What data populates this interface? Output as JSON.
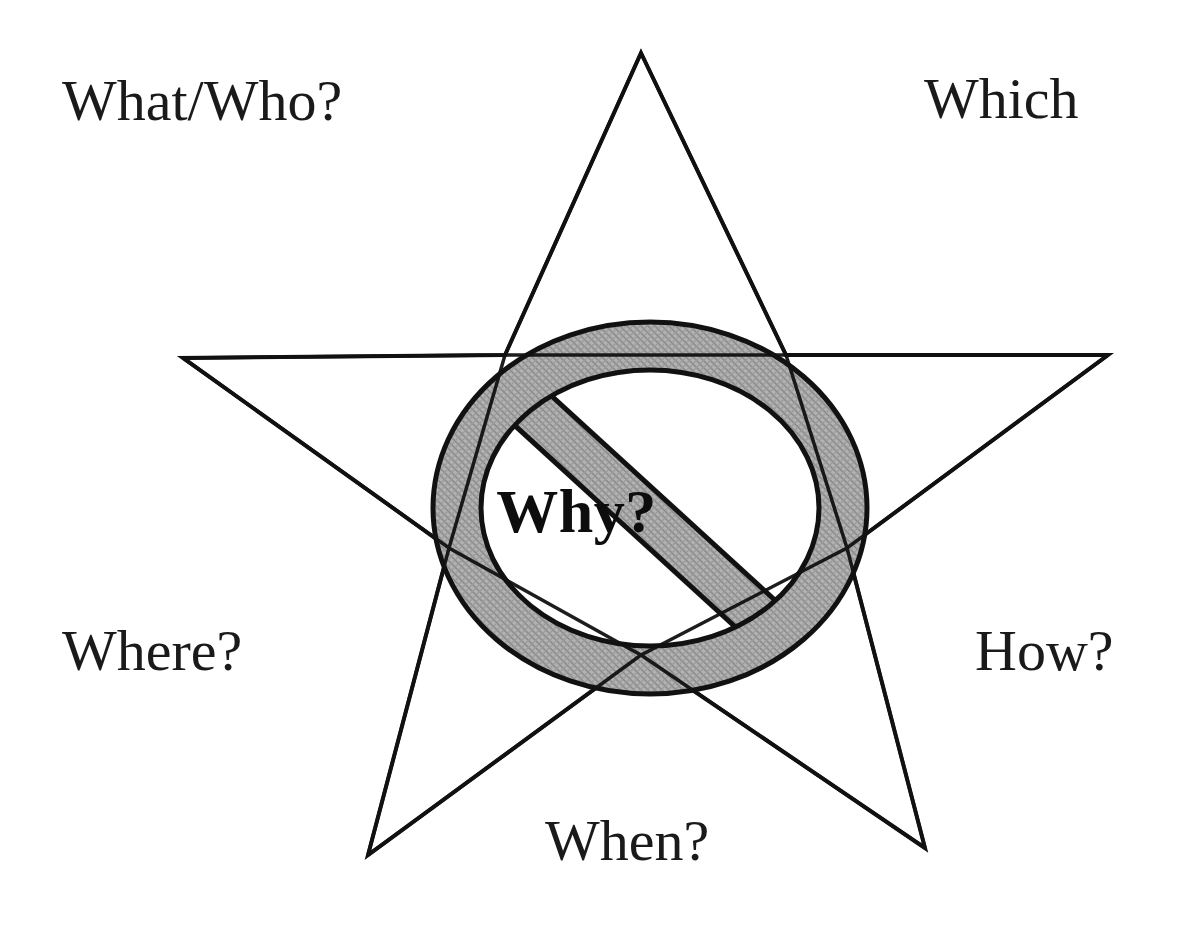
{
  "diagram": {
    "background_color": "#ffffff",
    "line_color": "#111111",
    "fill_gray": "#a8a8a8",
    "text_color": "#1a1a1a"
  },
  "labels": {
    "top_left": "What/Who?",
    "top_right": "Which",
    "bottom_left": "Where?",
    "bottom_right": "How?",
    "bottom_center": "When?",
    "center": "Why?"
  },
  "shapes": {
    "star": {
      "name": "five-pointed-star",
      "points": [
        {
          "x": 641,
          "y": 53
        },
        {
          "x": 1108,
          "y": 355
        },
        {
          "x": 925,
          "y": 848
        },
        {
          "x": 368,
          "y": 855
        },
        {
          "x": 183,
          "y": 358
        }
      ],
      "stroke": "#111111",
      "stroke_width": 4,
      "fill": "none"
    },
    "prohibition_sign": {
      "name": "no-entry-sign",
      "center": {
        "x": 650,
        "y": 508
      },
      "outer_rx": 217,
      "outer_ry": 186,
      "ring_thickness": 48,
      "slash_direction": "upper-left-to-lower-right",
      "fill": "#a8a8a8",
      "stroke": "#111111",
      "stroke_width": 5
    }
  }
}
